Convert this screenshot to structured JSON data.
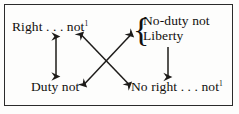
{
  "figure": {
    "border_color": "#2b2b2b",
    "text_color": "#12100e",
    "background": "#fdfdfc",
    "brace_glyph": "{"
  },
  "nodes": {
    "top_left": {
      "text": "Right . . . not",
      "superscript": "1"
    },
    "bottom_left": {
      "text": "Duty not",
      "superscript": ""
    },
    "bottom_right": {
      "text": "No right . . . not",
      "superscript": "1"
    },
    "top_right_group": {
      "line1": "No-duty not",
      "line2": "Liberty"
    }
  },
  "arrows": [
    {
      "name": "left-vertical-arrow",
      "heads": "both",
      "from": "Right . . . not",
      "to": "Duty not"
    },
    {
      "name": "right-vertical-arrow",
      "heads": "down",
      "from": "Liberty",
      "to": "No right . . . not"
    },
    {
      "name": "diagonal-arrow-right-to-noright",
      "heads": "both",
      "from": "Right . . . not",
      "to": "No right . . . not"
    },
    {
      "name": "diagonal-arrow-duty-to-noduty",
      "heads": "both",
      "from": "Duty not",
      "to": "No-duty not"
    }
  ]
}
